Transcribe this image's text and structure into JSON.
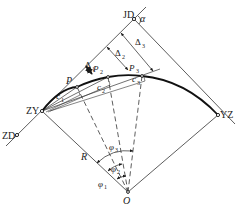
{
  "diagram": {
    "type": "circular-curve-deflection-angle-setout",
    "points": {
      "JD": {
        "label": "JD",
        "x": 134,
        "y": 19
      },
      "ZY": {
        "label": "ZY",
        "x": 42,
        "y": 111
      },
      "YZ": {
        "label": "YZ",
        "x": 218,
        "y": 115
      },
      "ZD": {
        "label": "ZD",
        "x": 17,
        "y": 135
      },
      "O": {
        "label": "O",
        "x": 128,
        "y": 192
      },
      "P1": {
        "label": "P",
        "sub": "1",
        "x": 77,
        "y": 87
      },
      "P2": {
        "label": "P",
        "sub": "2",
        "x": 108,
        "y": 77
      },
      "P3": {
        "label": "P",
        "sub": "3",
        "x": 142,
        "y": 76
      }
    },
    "labels": {
      "alpha": "α",
      "radius": "R",
      "delta1": "Δ",
      "delta1_sub": "1",
      "delta2": "Δ",
      "delta2_sub": "2",
      "delta3": "Δ",
      "delta3_sub": "3",
      "c1": "c",
      "c1_sub": "1",
      "c2": "c",
      "c2_sub": "2",
      "c3": "c",
      "c3_sub": "3",
      "phi1": "φ",
      "phi1_sub": "1",
      "phi2": "φ",
      "phi2_sub": "2",
      "phi3": "φ",
      "phi3_sub": "3",
      "p_tangent": "P"
    }
  }
}
